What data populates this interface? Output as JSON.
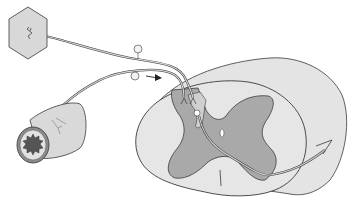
{
  "diagram": {
    "title": "",
    "labels": [],
    "colors": {
      "background": "#ffffff",
      "outline": "#3a3a3a",
      "white_matter": "#e4e4e4",
      "gray_matter": "#a9a9a9",
      "nerve_fiber": "#b8b8b8",
      "organ_fill": "#d8d8d8",
      "vessel_outer": "#8a8a8a",
      "vessel_lumen": "#555555",
      "vessel_body": "#d9d9d9"
    },
    "components": [
      {
        "id": "skin-receptor",
        "shape": "hexagon"
      },
      {
        "id": "somatic-afferent-fiber"
      },
      {
        "id": "visceral-afferent-fiber"
      },
      {
        "id": "dorsal-root-ganglion-cells",
        "count": 2
      },
      {
        "id": "direction-arrow"
      },
      {
        "id": "blood-vessel-cross-section"
      },
      {
        "id": "spinal-cord-segment"
      },
      {
        "id": "gray-matter-butterfly"
      },
      {
        "id": "central-canal"
      },
      {
        "id": "projection-neuron-with-ascending-arrow"
      }
    ]
  }
}
